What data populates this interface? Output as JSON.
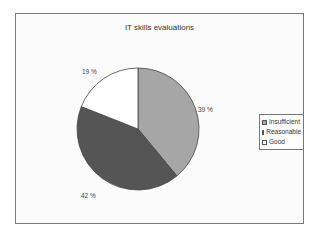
{
  "chart_data": {
    "type": "pie",
    "title": "IT skills evaluations",
    "categories": [
      "Insufficient",
      "Reasonable",
      "Good"
    ],
    "values": [
      39,
      42,
      19
    ],
    "value_labels": [
      "39 %",
      "42 %",
      "19 %"
    ],
    "colors": [
      "#a6a6a6",
      "#555555",
      "#ffffff"
    ],
    "legend_position": "right"
  },
  "legend": {
    "items": [
      {
        "label": "Insufficient",
        "color": "#a6a6a6"
      },
      {
        "label": "Reasonable",
        "color": "#555555"
      },
      {
        "label": "Good",
        "color": "#ffffff"
      }
    ]
  }
}
